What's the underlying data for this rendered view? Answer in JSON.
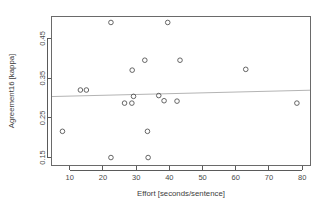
{
  "chart_data": {
    "type": "scatter",
    "title": "",
    "xlabel": "Effort [seconds/sentence]",
    "ylabel": "Agreement16 [kappa]",
    "xlim": [
      4.5,
      82.5
    ],
    "ylim": [
      0.13,
      0.505
    ],
    "grid": false,
    "legend": null,
    "xticks": [
      10,
      20,
      30,
      40,
      50,
      60,
      70,
      80
    ],
    "xticklabels": [
      "10",
      "20",
      "30",
      "40",
      "50",
      "60",
      "70",
      "80"
    ],
    "yticks": [
      0.15,
      0.25,
      0.35,
      0.45
    ],
    "yticklabels": [
      "0.15",
      "0.25",
      "0.35",
      "0.45"
    ],
    "marker": "open-circle",
    "marker_color": "#555555",
    "points": [
      {
        "x": 7.8,
        "y": 0.216
      },
      {
        "x": 13.2,
        "y": 0.32
      },
      {
        "x": 15.0,
        "y": 0.32
      },
      {
        "x": 22.4,
        "y": 0.49
      },
      {
        "x": 22.4,
        "y": 0.15
      },
      {
        "x": 26.5,
        "y": 0.287
      },
      {
        "x": 28.7,
        "y": 0.287
      },
      {
        "x": 28.8,
        "y": 0.37
      },
      {
        "x": 29.2,
        "y": 0.304
      },
      {
        "x": 32.6,
        "y": 0.395
      },
      {
        "x": 33.4,
        "y": 0.216
      },
      {
        "x": 33.6,
        "y": 0.15
      },
      {
        "x": 36.8,
        "y": 0.306
      },
      {
        "x": 38.4,
        "y": 0.293
      },
      {
        "x": 39.5,
        "y": 0.49
      },
      {
        "x": 42.3,
        "y": 0.292
      },
      {
        "x": 43.2,
        "y": 0.395
      },
      {
        "x": 63.0,
        "y": 0.372
      },
      {
        "x": 78.4,
        "y": 0.287
      }
    ],
    "trend_line": {
      "type": "linear-fit",
      "color": "#b4b4b4",
      "x_start": 4.5,
      "y_start": 0.3035,
      "x_end": 82.5,
      "y_end": 0.3195
    }
  }
}
